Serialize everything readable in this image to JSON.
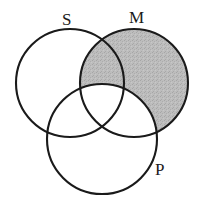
{
  "figure": {
    "type": "three-circle-venn-diagram",
    "width": 203,
    "height": 202,
    "background_color": "#ffffff",
    "stroke_color": "#1a1a1a",
    "shade_color": "#b9b9b9",
    "shade_description": "The M circle is shaded gray everywhere except the portion overlapping the P circle; the S-and-M lens above the P arc is shaded, the M-and-P region and the three-way center are left white."
  },
  "circles": [
    {
      "id": "S",
      "label": "S",
      "cx": 70,
      "cy": 83,
      "r": 54,
      "shaded": false
    },
    {
      "id": "M",
      "label": "M",
      "cx": 134,
      "cy": 83,
      "r": 54,
      "shaded": true
    },
    {
      "id": "P",
      "label": "P",
      "cx": 102,
      "cy": 139,
      "r": 55,
      "shaded": false
    }
  ],
  "labels": {
    "s": "S",
    "m": "M",
    "p": "P"
  }
}
